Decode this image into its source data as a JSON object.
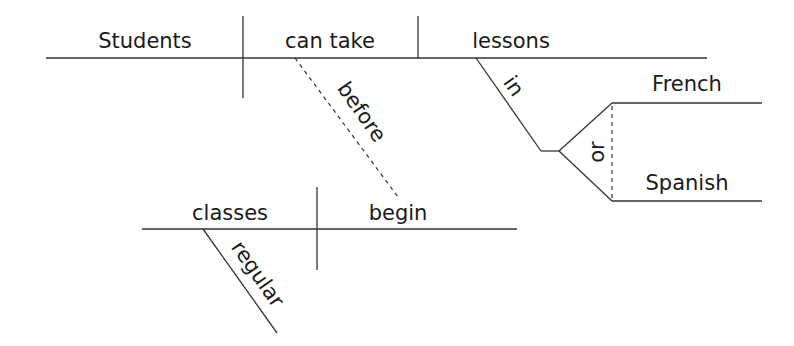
{
  "diagram": {
    "type": "Reed-Kellogg sentence diagram",
    "sentence": "Students can take lessons in French or Spanish before regular classes begin.",
    "main_clause": {
      "subject": "Students",
      "verb": "can take",
      "direct_object": "lessons",
      "prepositional_phrase": {
        "preposition": "in",
        "compound_object": {
          "conjunction": "or",
          "items": [
            "French",
            "Spanish"
          ]
        }
      }
    },
    "subordinating_conjunction": "before",
    "subordinate_clause": {
      "subject": "classes",
      "verb": "begin",
      "modifier": "regular"
    },
    "colors": {
      "line": "#333333",
      "text": "#1a1a1a",
      "background": "#ffffff"
    }
  }
}
